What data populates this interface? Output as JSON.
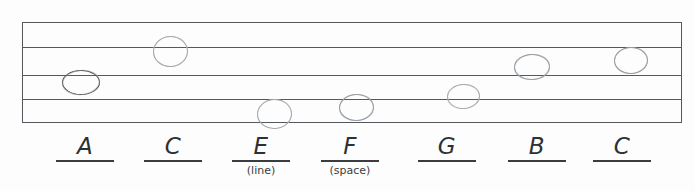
{
  "worksheet": {
    "title": "Music Staff Note Naming Worksheet",
    "staff": {
      "line_count": 5,
      "line_color": "#55585c",
      "background_color": "#fdfdfd"
    },
    "notes": [
      {
        "name": "note-A",
        "letter": "A",
        "position": "space",
        "staff_position": "space between line 3 and line 4",
        "x": 62,
        "y": 70,
        "width": 36,
        "height": 23,
        "shade": "dark"
      },
      {
        "name": "note-C",
        "letter": "C",
        "position": "line",
        "staff_position": "line 2",
        "x": 153,
        "y": 36,
        "width": 33,
        "height": 29,
        "shade": "faint"
      },
      {
        "name": "note-E",
        "letter": "E",
        "position": "line",
        "staff_position": "line 5",
        "x": 257,
        "y": 99,
        "width": 33,
        "height": 28,
        "shade": "faint"
      },
      {
        "name": "note-F",
        "letter": "F",
        "position": "space",
        "staff_position": "space between line 4 and line 5",
        "x": 339,
        "y": 94,
        "width": 33,
        "height": 25,
        "shade": "normal"
      },
      {
        "name": "note-G",
        "letter": "G",
        "position": "line",
        "staff_position": "line 4",
        "x": 447,
        "y": 84,
        "width": 31,
        "height": 23,
        "shade": "faint"
      },
      {
        "name": "note-B",
        "letter": "B",
        "position": "line",
        "staff_position": "line 3",
        "x": 514,
        "y": 54,
        "width": 34,
        "height": 24,
        "shade": "normal"
      },
      {
        "name": "note-C2",
        "letter": "C",
        "position": "space",
        "staff_position": "space between line 2 and line 3",
        "x": 614,
        "y": 47,
        "width": 32,
        "height": 25,
        "shade": "normal"
      }
    ],
    "answers": [
      {
        "letter": "A",
        "hint": "",
        "x": 50
      },
      {
        "letter": "C",
        "hint": "",
        "x": 138
      },
      {
        "letter": "E",
        "hint": "(line)",
        "x": 226
      },
      {
        "letter": "F",
        "hint": "(space)",
        "x": 315
      },
      {
        "letter": "G",
        "hint": "",
        "x": 412
      },
      {
        "letter": "B",
        "hint": "",
        "x": 502
      },
      {
        "letter": "C",
        "hint": "",
        "x": 587
      }
    ]
  }
}
